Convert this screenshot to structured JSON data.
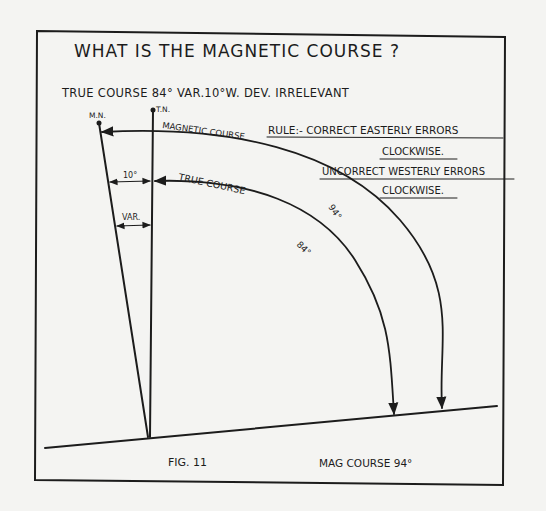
{
  "figure": {
    "title": "WHAT IS THE MAGNETIC COURSE ?",
    "given": "TRUE COURSE 84°  VAR.10°W.  DEV. IRRELEVANT",
    "caption": "FIG. 11",
    "answer": "MAG COURSE 94°"
  },
  "labels": {
    "magnetic_north": "M.N.",
    "true_north": "T.N.",
    "magnetic_course": "MAGNETIC COURSE",
    "true_course": "TRUE COURSE",
    "angle_10": "10°",
    "variation": "VAR.",
    "mag_value": "94°",
    "true_value": "84°"
  },
  "rule": {
    "line1": "RULE:-  CORRECT EASTERLY ERRORS",
    "line2": "CLOCKWISE.",
    "line3": "UNCORRECT WESTERLY ERRORS",
    "line4": "CLOCKWISE."
  },
  "colors": {
    "paper": "#f4f4f2",
    "ink": "#1c1c1c"
  }
}
